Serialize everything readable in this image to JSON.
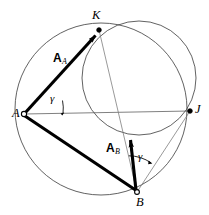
{
  "figure": {
    "background_color": "#ffffff",
    "stroke_color": "#000000",
    "thin_stroke_color": "#555555",
    "width": 209,
    "height": 215
  },
  "points": [
    {
      "id": "A",
      "label": "A",
      "x": 24,
      "y": 114,
      "label_x": 12,
      "label_y": 108,
      "marker": "open-circle"
    },
    {
      "id": "K",
      "label": "K",
      "x": 99,
      "y": 30,
      "label_x": 92,
      "label_y": 10,
      "marker": "filled-dot"
    },
    {
      "id": "J",
      "label": "J",
      "x": 190,
      "y": 111,
      "label_x": 195,
      "label_y": 104,
      "marker": "filled-dot"
    },
    {
      "id": "B",
      "label": "B",
      "x": 137,
      "y": 192,
      "label_x": 136,
      "label_y": 197,
      "marker": "open-circle"
    }
  ],
  "vectors": [
    {
      "id": "A_A",
      "label_main": "A",
      "label_sub": "A",
      "from": "A",
      "to": "K",
      "label_x": 53,
      "label_y": 50,
      "style": "thick-arrow"
    },
    {
      "id": "A_B",
      "label_main": "A",
      "label_sub": "B",
      "from": "B",
      "to": "inner-circle-bottom",
      "label_x": 107,
      "label_y": 140,
      "style": "thick-arrow"
    }
  ],
  "angles": [
    {
      "id": "gamma-at-A",
      "label": "γ",
      "vertex": "A",
      "label_x": 50,
      "label_y": 94,
      "between": [
        "AK",
        "AJ"
      ]
    },
    {
      "id": "gamma-at-B",
      "label": "γ",
      "vertex": "B",
      "label_x": 138,
      "label_y": 152,
      "between": [
        "BA_B",
        "BJ"
      ]
    }
  ],
  "segments": [
    {
      "id": "segment-A-B",
      "from": "A",
      "to": "B",
      "style": "thick"
    },
    {
      "id": "segment-A-J",
      "from": "A",
      "to": "J",
      "style": "thin"
    },
    {
      "id": "segment-K-B",
      "from": "K",
      "to": "B",
      "style": "thin"
    },
    {
      "id": "segment-B-J",
      "from": "B",
      "to": "J",
      "style": "thin"
    }
  ],
  "circles": [
    {
      "id": "outer-circle",
      "cx": 101,
      "cy": 109,
      "r": 86,
      "style": "thin",
      "through": [
        "A",
        "K",
        "B"
      ]
    },
    {
      "id": "inner-circle",
      "cx": 139,
      "cy": 78,
      "r": 57,
      "style": "thin",
      "through": [
        "K",
        "J"
      ]
    }
  ]
}
